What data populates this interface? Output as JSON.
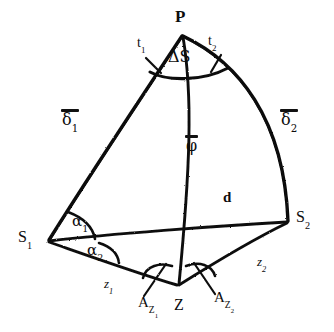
{
  "figure": {
    "background_color": "#ffffff",
    "stroke_color": "#111111",
    "width": 334,
    "height": 332
  },
  "vertices": {
    "p": {
      "label": "P",
      "x": 182,
      "y": 35
    },
    "s1": {
      "label": "S",
      "sub": "1",
      "x": 48,
      "y": 241
    },
    "s2": {
      "label": "S",
      "sub": "2",
      "x": 287,
      "y": 222
    },
    "z": {
      "label": "Z",
      "x": 178,
      "y": 285
    }
  },
  "labels": {
    "apex": "P",
    "apex_angle": "ΔS",
    "tangent_1": "t",
    "tangent_1_sub": "1",
    "tangent_2": "t",
    "tangent_2_sub": "2",
    "delta_1": "δ",
    "delta_1_sub": "1",
    "delta_2": "δ",
    "delta_2_sub": "2",
    "phi": "φ",
    "distance": "d",
    "alpha_1": "α",
    "alpha_1_sub": "1",
    "alpha_2": "α",
    "alpha_2_sub": "2",
    "station_1": "S",
    "station_1_sub": "1",
    "station_2": "S",
    "station_2_sub": "2",
    "zenith": "Z",
    "zenith_dist_1": "z",
    "zenith_dist_1_sub": "1",
    "zenith_dist_2": "z",
    "zenith_dist_2_sub": "2",
    "azimuth_1": "A",
    "azimuth_1_sub": "Z",
    "azimuth_1_subsub": "1",
    "azimuth_2": "A",
    "azimuth_2_sub": "Z",
    "azimuth_2_subsub": "2"
  },
  "overbars": {
    "delta_1": true,
    "delta_2": true,
    "phi": true
  }
}
